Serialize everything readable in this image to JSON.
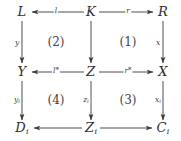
{
  "diagram": {
    "type": "commutative-diagram",
    "nodes": [
      {
        "id": "L",
        "label": "L",
        "sub": "",
        "x": 22,
        "y": 12
      },
      {
        "id": "K",
        "label": "K",
        "sub": "",
        "x": 91,
        "y": 12
      },
      {
        "id": "R",
        "label": "R",
        "sub": "",
        "x": 163,
        "y": 12
      },
      {
        "id": "Y",
        "label": "Y",
        "sub": "",
        "x": 22,
        "y": 72
      },
      {
        "id": "Z",
        "label": "Z",
        "sub": "",
        "x": 91,
        "y": 72
      },
      {
        "id": "X",
        "label": "X",
        "sub": "",
        "x": 163,
        "y": 72
      },
      {
        "id": "Di",
        "label": "D",
        "sub": "i",
        "x": 22,
        "y": 128
      },
      {
        "id": "Zi",
        "label": "Z",
        "sub": "i",
        "x": 91,
        "y": 128
      },
      {
        "id": "Ci",
        "label": "C",
        "sub": "i",
        "x": 163,
        "y": 128
      }
    ],
    "edges": [
      {
        "id": "K-to-L",
        "from": "K",
        "to": "L",
        "label": "l",
        "sub": "",
        "star": false,
        "label_x": 56,
        "label_y": 11
      },
      {
        "id": "K-to-R",
        "from": "K",
        "to": "R",
        "label": "r",
        "sub": "",
        "star": false,
        "label_x": 128,
        "label_y": 11
      },
      {
        "id": "Z-to-Y",
        "from": "Z",
        "to": "Y",
        "label": "l",
        "sub": "",
        "star": true,
        "label_x": 56,
        "label_y": 71
      },
      {
        "id": "Z-to-X",
        "from": "Z",
        "to": "X",
        "label": "r",
        "sub": "",
        "star": true,
        "label_x": 128,
        "label_y": 71
      },
      {
        "id": "Zi-to-Di",
        "from": "Zi",
        "to": "Di",
        "label": "",
        "sub": "",
        "star": false,
        "label_x": 56,
        "label_y": 127
      },
      {
        "id": "Zi-to-Ci",
        "from": "Zi",
        "to": "Ci",
        "label": "",
        "sub": "",
        "star": false,
        "label_x": 128,
        "label_y": 127
      },
      {
        "id": "L-to-Y",
        "from": "L",
        "to": "Y",
        "label": "y",
        "sub": "",
        "star": false,
        "label_x": 17,
        "label_y": 43
      },
      {
        "id": "K-to-Z",
        "from": "K",
        "to": "Z",
        "label": "",
        "sub": "",
        "star": false,
        "label_x": 86,
        "label_y": 43
      },
      {
        "id": "R-to-X",
        "from": "R",
        "to": "X",
        "label": "x",
        "sub": "",
        "star": false,
        "label_x": 158,
        "label_y": 43
      },
      {
        "id": "Y-to-Di",
        "from": "Y",
        "to": "Di",
        "label": "y",
        "sub": "i",
        "star": false,
        "label_x": 17,
        "label_y": 100
      },
      {
        "id": "Z-to-Zi",
        "from": "Z",
        "to": "Zi",
        "label": "z",
        "sub": "i",
        "star": false,
        "label_x": 86,
        "label_y": 100
      },
      {
        "id": "X-to-Ci",
        "from": "X",
        "to": "Ci",
        "label": "x",
        "sub": "i",
        "star": false,
        "label_x": 158,
        "label_y": 100
      }
    ],
    "regions": [
      {
        "id": "region-1",
        "label": "(1)",
        "x": 128,
        "y": 42
      },
      {
        "id": "region-2",
        "label": "(2)",
        "x": 56,
        "y": 42
      },
      {
        "id": "region-3",
        "label": "(3)",
        "x": 128,
        "y": 100
      },
      {
        "id": "region-4",
        "label": "(4)",
        "x": 56,
        "y": 100
      }
    ],
    "colors": {
      "stroke": "#3a3a3a",
      "text": "#2e2e2e",
      "background": "#ffffff"
    }
  }
}
